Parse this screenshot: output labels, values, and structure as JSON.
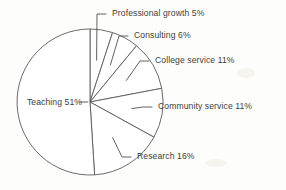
{
  "chart_data": {
    "type": "pie",
    "title": "",
    "subtitle": "",
    "xlabel": "",
    "ylabel": "",
    "legend_position": "none",
    "grid": false,
    "start_angle_deg": 0,
    "direction": "clockwise",
    "units": "percent",
    "total": 100,
    "categories": [
      "Professional growth",
      "Consulting",
      "College service",
      "Community service",
      "Research",
      "Teaching"
    ],
    "values": [
      5,
      6,
      11,
      11,
      16,
      51
    ],
    "slices": [
      {
        "name": "Professional growth",
        "value": 5,
        "value_text": "5%",
        "label": "Professional growth  5%",
        "label_placement": "outside",
        "start_deg": 0,
        "end_deg": 18
      },
      {
        "name": "Consulting",
        "value": 6,
        "value_text": "6%",
        "label": "Consulting  6%",
        "label_placement": "outside",
        "start_deg": 18,
        "end_deg": 39.6
      },
      {
        "name": "College service",
        "value": 11,
        "value_text": "11%",
        "label": "College service  11%",
        "label_placement": "outside",
        "start_deg": 39.6,
        "end_deg": 79.2
      },
      {
        "name": "Community service",
        "value": 11,
        "value_text": "11%",
        "label": "Community service  11%",
        "label_placement": "outside",
        "start_deg": 79.2,
        "end_deg": 118.8
      },
      {
        "name": "Research",
        "value": 16,
        "value_text": "16%",
        "label": "Research  16%",
        "label_placement": "outside",
        "start_deg": 118.8,
        "end_deg": 176.4
      },
      {
        "name": "Teaching",
        "value": 51,
        "value_text": "51%",
        "label": "Teaching 51%",
        "label_placement": "inside",
        "start_deg": 176.4,
        "end_deg": 360
      }
    ],
    "colors": {
      "slice_fill": "#ffffff",
      "slice_stroke": "#5a5a5a",
      "leader_line": "#4f4f4f",
      "label_text": "#3d3d3d",
      "background": "#fdfdfb"
    },
    "geometry": {
      "center_x": 90,
      "center_y": 102,
      "radius": 73
    }
  }
}
